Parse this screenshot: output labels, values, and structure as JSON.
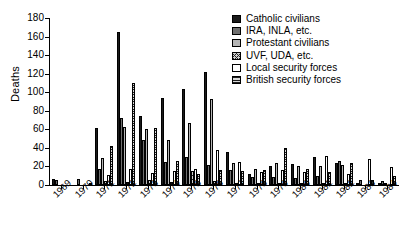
{
  "chart_data": {
    "type": "bar",
    "title": "",
    "xlabel": "",
    "ylabel": "Deaths",
    "ylim": [
      0,
      180
    ],
    "ytick_step": 20,
    "yticks": [
      0,
      20,
      40,
      60,
      80,
      100,
      120,
      140,
      160,
      180
    ],
    "grid": false,
    "legend_position": "top-right",
    "categories": [
      "1969",
      "1970",
      "1971",
      "1972",
      "1973",
      "1974",
      "1975",
      "1976",
      "1977",
      "1978",
      "1979",
      "1980",
      "1981",
      "1982",
      "1983",
      "1984"
    ],
    "series": [
      {
        "name": "Catholic civilians",
        "color": "#1a1a1a",
        "pattern": "solid-black",
        "values": [
          6,
          0,
          61,
          165,
          74,
          94,
          103,
          122,
          36,
          12,
          20,
          23,
          30,
          24,
          1,
          2
        ]
      },
      {
        "name": "IRA, INLA, etc.",
        "color": "#6e6e6e",
        "pattern": "solid-grey",
        "values": [
          5,
          7,
          17,
          72,
          48,
          25,
          30,
          22,
          16,
          9,
          9,
          8,
          10,
          26,
          5,
          4
        ]
      },
      {
        "name": "Protestant civilians",
        "color": "#b5b5b5",
        "pattern": "light-grey",
        "values": [
          0,
          0,
          29,
          62,
          60,
          49,
          67,
          93,
          24,
          17,
          24,
          21,
          21,
          22,
          0,
          2
        ]
      },
      {
        "name": "UVF, UDA, etc.",
        "color": "#cfcfcf",
        "pattern": "crosshatch",
        "values": [
          0,
          0,
          4,
          3,
          5,
          3,
          15,
          4,
          2,
          1,
          1,
          1,
          2,
          2,
          0,
          0
        ]
      },
      {
        "name": "Local security forces",
        "color": "#ffffff",
        "pattern": "white",
        "values": [
          0,
          0,
          11,
          17,
          13,
          15,
          17,
          38,
          25,
          14,
          16,
          14,
          31,
          12,
          28,
          19
        ]
      },
      {
        "name": "British security forces",
        "color": "#8f8f8f",
        "pattern": "horiz-lines",
        "values": [
          0,
          1,
          42,
          110,
          61,
          26,
          12,
          16,
          15,
          16,
          40,
          17,
          14,
          24,
          5,
          10
        ]
      }
    ]
  },
  "legend": {
    "items": [
      {
        "label": "Catholic civilians",
        "icon": "legend-swatch-catholic-civilians"
      },
      {
        "label": "IRA, INLA, etc.",
        "icon": "legend-swatch-ira-inla"
      },
      {
        "label": "Protestant civilians",
        "icon": "legend-swatch-protestant-civilians"
      },
      {
        "label": "UVF, UDA, etc.",
        "icon": "legend-swatch-uvf-uda"
      },
      {
        "label": "Local security forces",
        "icon": "legend-swatch-local-security-forces"
      },
      {
        "label": "British security forces",
        "icon": "legend-swatch-british-security-forces"
      }
    ]
  }
}
